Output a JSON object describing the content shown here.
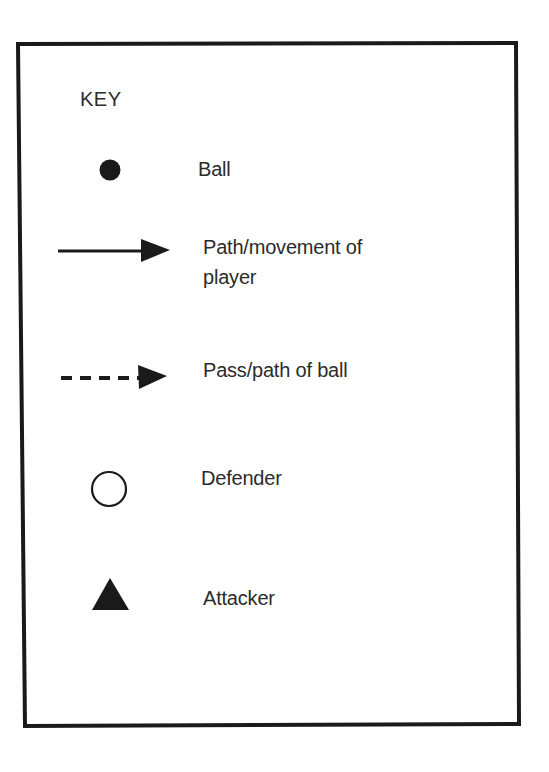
{
  "key": {
    "title": "KEY",
    "items": [
      {
        "symbol": "filled-circle",
        "label": "Ball"
      },
      {
        "symbol": "solid-arrow",
        "label_line1": "Path/movement of",
        "label_line2": "player"
      },
      {
        "symbol": "dashed-arrow",
        "label": "Pass/path of ball"
      },
      {
        "symbol": "open-circle",
        "label": "Defender"
      },
      {
        "symbol": "filled-triangle",
        "label": "Attacker"
      }
    ]
  },
  "colors": {
    "ink": "#1a1a1a",
    "background": "#ffffff"
  }
}
